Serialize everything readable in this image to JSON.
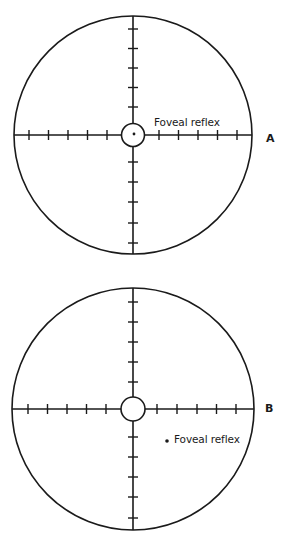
{
  "figure": {
    "panels": [
      {
        "id": "A",
        "label": "A",
        "annotation": "Foveal reflex",
        "reflex_position": "centered",
        "center": [
          133,
          135
        ],
        "radius": 119,
        "tick_spacing": 19.5,
        "ticks_per_arm": 5
      },
      {
        "id": "B",
        "label": "B",
        "annotation": "Foveal reflex",
        "reflex_position": "displaced inferotemporally",
        "center": [
          133,
          409
        ],
        "radius": 121,
        "tick_spacing": 19.5,
        "ticks_per_arm": 5
      }
    ],
    "colors": {
      "line": "#1a1a1a",
      "background": "#ffffff"
    }
  }
}
